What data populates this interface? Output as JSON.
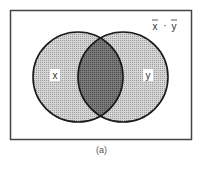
{
  "diagram": {
    "type": "venn",
    "frame": {
      "x": 10,
      "y": 10,
      "width": 182,
      "height": 130
    },
    "sets": [
      {
        "name": "x",
        "label": "x",
        "cx": 78,
        "cy": 77,
        "r": 45
      },
      {
        "name": "y",
        "label": "y",
        "cx": 123,
        "cy": 77,
        "r": 45
      }
    ],
    "complement_label": {
      "text_left": "x",
      "operator": "·",
      "text_right": "y",
      "overbar": true
    },
    "intersection_shading": "dark",
    "colors": {
      "set_fill": "#c8c8c8",
      "intersection_fill": "#6e6e6e",
      "outline": "#1a1a1a",
      "frame": "#444444"
    }
  },
  "caption": "(a)"
}
